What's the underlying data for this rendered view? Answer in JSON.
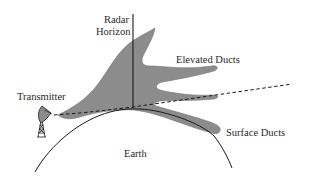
{
  "diagram": {
    "labels": {
      "radar_horizon_line1": "Radar",
      "radar_horizon_line2": "Horizon",
      "transmitter": "Transmitter",
      "elevated_ducts": "Elevated Ducts",
      "surface_ducts": "Surface Ducts",
      "earth": "Earth"
    },
    "colors": {
      "duct_fill": "#8c8c8c",
      "duct_stroke": "#6e6e6e",
      "line": "#1a1a1a",
      "text": "#2a2a2a",
      "background": "#ffffff"
    },
    "elements": [
      {
        "id": "radar-horizon-line",
        "type": "vertical-line"
      },
      {
        "id": "earth-surface",
        "type": "arc"
      },
      {
        "id": "line-of-sight",
        "type": "dashed-line"
      },
      {
        "id": "duct-region",
        "type": "filled-shape"
      },
      {
        "id": "transmitter-antenna",
        "type": "icon"
      }
    ]
  }
}
